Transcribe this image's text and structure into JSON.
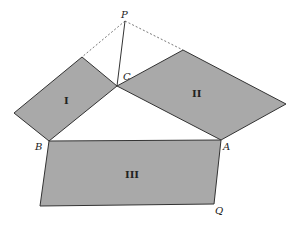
{
  "diagram": {
    "type": "geometry",
    "colors": {
      "fill": "#a9a9a9",
      "stroke": "#333333",
      "background": "#ffffff"
    },
    "points": {
      "P": {
        "label": "P",
        "x": 125,
        "y": 21
      },
      "C": {
        "label": "C",
        "x": 117,
        "y": 86
      },
      "A": {
        "label": "A",
        "x": 221,
        "y": 140
      },
      "B": {
        "label": "B",
        "x": 49,
        "y": 141
      },
      "Q": {
        "label": "Q",
        "x": 214,
        "y": 204
      }
    },
    "regions": {
      "I": {
        "label": "I"
      },
      "II": {
        "label": "II"
      },
      "III": {
        "label": "III"
      }
    }
  }
}
